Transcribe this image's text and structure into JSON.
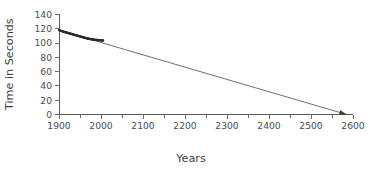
{
  "chart_data": {
    "type": "scatter",
    "title": "",
    "subtitle": "",
    "xlabel": "Years",
    "ylabel": "Time in Seconds",
    "xlim": [
      1900,
      2600
    ],
    "ylim": [
      0,
      140
    ],
    "xticks": [
      1900,
      2000,
      2100,
      2200,
      2300,
      2400,
      2500,
      2600
    ],
    "xtick_labels": [
      "1900",
      "2000",
      "2100",
      "2200",
      "2300",
      "2400",
      "2500",
      "2600"
    ],
    "xminor_ticks": [
      1950,
      2050,
      2150,
      2250,
      2350,
      2450,
      2550
    ],
    "yticks": [
      0,
      20,
      40,
      60,
      80,
      100,
      120,
      140
    ],
    "ytick_labels": [
      "0",
      "20",
      "40",
      "60",
      "80",
      "100",
      "120",
      "140"
    ],
    "grid": false,
    "legend": null,
    "legend_position": "none",
    "series": [
      {
        "name": "Observed records",
        "type": "scatter",
        "marker_color": "#2b2b2b",
        "points": [
          [
            1900,
            118.0
          ],
          [
            1901,
            117.8
          ],
          [
            1902,
            117.6
          ],
          [
            1903,
            117.4
          ],
          [
            1904,
            117.2
          ],
          [
            1905,
            117.0
          ],
          [
            1906,
            116.8
          ],
          [
            1907,
            116.6
          ],
          [
            1908,
            116.4
          ],
          [
            1909,
            116.2
          ],
          [
            1910,
            116.0
          ],
          [
            1911,
            115.9
          ],
          [
            1912,
            115.7
          ],
          [
            1913,
            115.5
          ],
          [
            1914,
            115.3
          ],
          [
            1915,
            115.2
          ],
          [
            1916,
            115.0
          ],
          [
            1917,
            114.8
          ],
          [
            1918,
            114.7
          ],
          [
            1919,
            114.5
          ],
          [
            1920,
            114.3
          ],
          [
            1921,
            114.2
          ],
          [
            1922,
            114.0
          ],
          [
            1923,
            113.8
          ],
          [
            1924,
            113.7
          ],
          [
            1925,
            113.5
          ],
          [
            1926,
            113.3
          ],
          [
            1927,
            113.2
          ],
          [
            1928,
            113.0
          ],
          [
            1929,
            112.8
          ],
          [
            1930,
            112.7
          ],
          [
            1931,
            112.5
          ],
          [
            1932,
            112.3
          ],
          [
            1933,
            112.2
          ],
          [
            1934,
            112.0
          ],
          [
            1935,
            111.8
          ],
          [
            1936,
            111.6
          ],
          [
            1937,
            111.5
          ],
          [
            1938,
            111.3
          ],
          [
            1939,
            111.1
          ],
          [
            1940,
            111.0
          ],
          [
            1941,
            110.8
          ],
          [
            1942,
            110.6
          ],
          [
            1943,
            110.5
          ],
          [
            1944,
            110.3
          ],
          [
            1945,
            110.1
          ],
          [
            1946,
            110.0
          ],
          [
            1947,
            109.8
          ],
          [
            1948,
            109.6
          ],
          [
            1949,
            109.5
          ],
          [
            1950,
            109.3
          ],
          [
            1951,
            109.1
          ],
          [
            1952,
            109.0
          ],
          [
            1953,
            108.8
          ],
          [
            1954,
            108.6
          ],
          [
            1955,
            108.5
          ],
          [
            1956,
            108.3
          ],
          [
            1957,
            108.1
          ],
          [
            1958,
            108.0
          ],
          [
            1959,
            107.8
          ],
          [
            1960,
            107.6
          ],
          [
            1961,
            107.5
          ],
          [
            1962,
            107.3
          ],
          [
            1963,
            107.1
          ],
          [
            1964,
            107.0
          ],
          [
            1965,
            106.8
          ],
          [
            1966,
            106.7
          ],
          [
            1967,
            106.5
          ],
          [
            1968,
            106.4
          ],
          [
            1969,
            106.2
          ],
          [
            1970,
            106.1
          ],
          [
            1971,
            106.0
          ],
          [
            1972,
            105.8
          ],
          [
            1973,
            105.7
          ],
          [
            1974,
            105.6
          ],
          [
            1975,
            105.5
          ],
          [
            1976,
            105.4
          ],
          [
            1977,
            105.3
          ],
          [
            1978,
            105.2
          ],
          [
            1979,
            105.1
          ],
          [
            1980,
            105.0
          ],
          [
            1981,
            104.9
          ],
          [
            1982,
            104.8
          ],
          [
            1983,
            104.8
          ],
          [
            1984,
            104.7
          ],
          [
            1985,
            104.6
          ],
          [
            1986,
            104.6
          ],
          [
            1987,
            104.5
          ],
          [
            1988,
            104.4
          ],
          [
            1989,
            104.4
          ],
          [
            1990,
            104.3
          ],
          [
            1991,
            104.3
          ],
          [
            1992,
            104.2
          ],
          [
            1993,
            104.2
          ],
          [
            1994,
            104.1
          ],
          [
            1995,
            104.1
          ],
          [
            1996,
            104.0
          ],
          [
            1997,
            104.0
          ],
          [
            1998,
            103.9
          ],
          [
            1999,
            103.9
          ],
          [
            2000,
            103.8
          ],
          [
            2001,
            103.8
          ],
          [
            2002,
            103.7
          ],
          [
            2003,
            103.7
          ],
          [
            2004,
            103.6
          ],
          [
            2005,
            103.6
          ]
        ]
      },
      {
        "name": "Extrapolated trend",
        "type": "line",
        "line_color": "#555555",
        "arrow_end": true,
        "endpoints": [
          [
            1900,
            118.0
          ],
          [
            2585,
            0.0
          ]
        ]
      }
    ]
  },
  "axes": {
    "y_title": "Time in Seconds",
    "x_title": "Years"
  }
}
